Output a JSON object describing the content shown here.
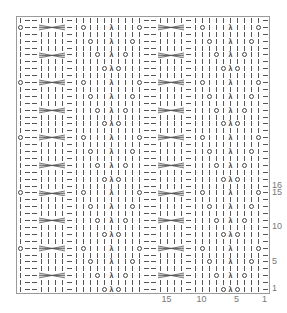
{
  "chart": {
    "columns": 36,
    "rows": 40,
    "cell_width": 7,
    "cell_height": 6.9,
    "repeat_width": 17,
    "repeat_height": 8,
    "symbols": {
      "k": "knit (vertical bar)",
      "p": "purl (horizontal dash)",
      "yo": "yarn over (circle)",
      "s2kp": "centered double decrease (λ)",
      "cable": "4-st cable cross"
    },
    "symbol_glyphs": {
      "s2kp": "λ"
    },
    "repeat_rows_right_to_left": [
      [
        "p",
        "k",
        "k",
        "k",
        "yo",
        "s2kp",
        "yo",
        "k",
        "k",
        "k",
        "k",
        "p",
        "k",
        "k",
        "k",
        "k",
        "p"
      ],
      [
        "p",
        "k",
        "k",
        "k",
        "k",
        "k",
        "k",
        "k",
        "k",
        "k",
        "k",
        "p",
        "k",
        "k",
        "k",
        "k",
        "p"
      ],
      [
        "p",
        "k",
        "k",
        "yo",
        "k",
        "s2kp",
        "k",
        "yo",
        "k",
        "k",
        "k",
        "p",
        "cable",
        "",
        "",
        "",
        "p"
      ],
      [
        "p",
        "k",
        "k",
        "k",
        "k",
        "k",
        "k",
        "k",
        "k",
        "k",
        "k",
        "p",
        "k",
        "k",
        "k",
        "k",
        "p"
      ],
      [
        "p",
        "k",
        "yo",
        "k",
        "k",
        "s2kp",
        "k",
        "k",
        "yo",
        "k",
        "k",
        "p",
        "k",
        "k",
        "k",
        "k",
        "p"
      ],
      [
        "p",
        "k",
        "k",
        "k",
        "k",
        "k",
        "k",
        "k",
        "k",
        "k",
        "k",
        "p",
        "k",
        "k",
        "k",
        "k",
        "p"
      ],
      [
        "p",
        "yo",
        "k",
        "k",
        "k",
        "s2kp",
        "k",
        "k",
        "k",
        "yo",
        "k",
        "p",
        "cable",
        "",
        "",
        "",
        "p"
      ],
      [
        "p",
        "k",
        "k",
        "k",
        "k",
        "k",
        "k",
        "k",
        "k",
        "k",
        "k",
        "p",
        "k",
        "k",
        "k",
        "k",
        "p"
      ]
    ],
    "row_labels": [
      {
        "label": "1",
        "row": 1
      },
      {
        "label": "5",
        "row": 5
      },
      {
        "label": "10",
        "row": 10
      },
      {
        "label": "15",
        "row": 15
      },
      {
        "label": "16",
        "row": 16
      }
    ],
    "col_labels": [
      {
        "label": "1",
        "col": 1
      },
      {
        "label": "5",
        "col": 5
      },
      {
        "label": "10",
        "col": 10
      },
      {
        "label": "15",
        "col": 15
      }
    ],
    "colors": {
      "line": "#555555",
      "border": "#9a9a9a",
      "label": "#777777"
    }
  }
}
